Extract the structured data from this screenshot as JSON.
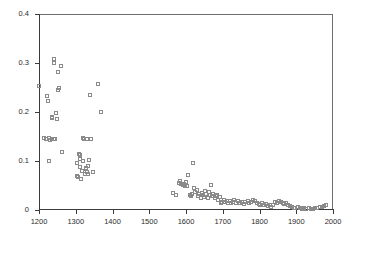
{
  "chart_data": {
    "type": "scatter",
    "title": "",
    "xlabel": "",
    "ylabel": "",
    "xlim": [
      1200,
      2000
    ],
    "ylim": [
      0,
      0.4
    ],
    "xticks": [
      1200,
      1300,
      1400,
      1500,
      1600,
      1700,
      1800,
      1900,
      2000
    ],
    "xtick_labels": [
      "1200",
      "1300",
      "1400",
      "1500",
      "1600",
      "1700",
      "1800",
      "1900",
      "2000"
    ],
    "yticks": [
      0,
      0.1,
      0.2,
      0.3,
      0.4
    ],
    "ytick_labels": [
      "0",
      "0.1",
      "0.2",
      "0.3",
      "0.4"
    ],
    "grid": false,
    "legend": null,
    "marker": "open-square",
    "marker_color": "#8a8a8a",
    "frame_color": "#3a3a3a",
    "series": [
      {
        "name": "series-1",
        "points": [
          [
            1200,
            0.252
          ],
          [
            1222,
            0.231
          ],
          [
            1226,
            0.221
          ],
          [
            1236,
            0.189
          ],
          [
            1238,
            0.186
          ],
          [
            1243,
            0.307
          ],
          [
            1243,
            0.299
          ],
          [
            1248,
            0.196
          ],
          [
            1250,
            0.185
          ],
          [
            1252,
            0.281
          ],
          [
            1254,
            0.243
          ],
          [
            1257,
            0.247
          ],
          [
            1262,
            0.292
          ],
          [
            1216,
            0.145
          ],
          [
            1221,
            0.143
          ],
          [
            1229,
            0.146
          ],
          [
            1232,
            0.141
          ],
          [
            1236,
            0.144
          ],
          [
            1241,
            0.143
          ],
          [
            1246,
            0.144
          ],
          [
            1228,
            0.1
          ],
          [
            1263,
            0.118
          ],
          [
            1305,
            0.094
          ],
          [
            1306,
            0.069
          ],
          [
            1308,
            0.066
          ],
          [
            1311,
            0.114
          ],
          [
            1312,
            0.111
          ],
          [
            1313,
            0.086
          ],
          [
            1314,
            0.104
          ],
          [
            1316,
            0.063
          ],
          [
            1318,
            0.079
          ],
          [
            1321,
            0.1
          ],
          [
            1322,
            0.146
          ],
          [
            1325,
            0.143
          ],
          [
            1327,
            0.073
          ],
          [
            1329,
            0.085
          ],
          [
            1330,
            0.082
          ],
          [
            1331,
            0.076
          ],
          [
            1333,
            0.143
          ],
          [
            1334,
            0.088
          ],
          [
            1336,
            0.073
          ],
          [
            1337,
            0.102
          ],
          [
            1339,
            0.234
          ],
          [
            1344,
            0.143
          ],
          [
            1347,
            0.076
          ],
          [
            1362,
            0.256
          ],
          [
            1370,
            0.2
          ],
          [
            1567,
            0.034
          ],
          [
            1574,
            0.03
          ],
          [
            1583,
            0.055
          ],
          [
            1586,
            0.058
          ],
          [
            1588,
            0.053
          ],
          [
            1592,
            0.051
          ],
          [
            1596,
            0.053
          ],
          [
            1599,
            0.048
          ],
          [
            1602,
            0.056
          ],
          [
            1605,
            0.048
          ],
          [
            1608,
            0.071
          ],
          [
            1611,
            0.029
          ],
          [
            1614,
            0.027
          ],
          [
            1617,
            0.031
          ],
          [
            1621,
            0.095
          ],
          [
            1624,
            0.043
          ],
          [
            1627,
            0.036
          ],
          [
            1631,
            0.04
          ],
          [
            1634,
            0.027
          ],
          [
            1637,
            0.032
          ],
          [
            1641,
            0.024
          ],
          [
            1644,
            0.034
          ],
          [
            1647,
            0.03
          ],
          [
            1650,
            0.026
          ],
          [
            1654,
            0.037
          ],
          [
            1657,
            0.031
          ],
          [
            1660,
            0.023
          ],
          [
            1663,
            0.036
          ],
          [
            1666,
            0.029
          ],
          [
            1670,
            0.049
          ],
          [
            1673,
            0.027
          ],
          [
            1676,
            0.031
          ],
          [
            1679,
            0.024
          ],
          [
            1683,
            0.027
          ],
          [
            1686,
            0.03
          ],
          [
            1689,
            0.02
          ],
          [
            1693,
            0.025
          ],
          [
            1696,
            0.013
          ],
          [
            1700,
            0.016
          ],
          [
            1704,
            0.02
          ],
          [
            1708,
            0.015
          ],
          [
            1712,
            0.018
          ],
          [
            1716,
            0.014
          ],
          [
            1720,
            0.017
          ],
          [
            1724,
            0.013
          ],
          [
            1729,
            0.016
          ],
          [
            1733,
            0.019
          ],
          [
            1738,
            0.014
          ],
          [
            1743,
            0.017
          ],
          [
            1748,
            0.013
          ],
          [
            1753,
            0.016
          ],
          [
            1758,
            0.012
          ],
          [
            1763,
            0.015
          ],
          [
            1769,
            0.018
          ],
          [
            1774,
            0.014
          ],
          [
            1779,
            0.016
          ],
          [
            1784,
            0.019
          ],
          [
            1789,
            0.017
          ],
          [
            1794,
            0.014
          ],
          [
            1799,
            0.012
          ],
          [
            1804,
            0.01
          ],
          [
            1809,
            0.013
          ],
          [
            1814,
            0.009
          ],
          [
            1819,
            0.011
          ],
          [
            1824,
            0.007
          ],
          [
            1829,
            0.009
          ],
          [
            1834,
            0.006
          ],
          [
            1839,
            0.01
          ],
          [
            1844,
            0.016
          ],
          [
            1849,
            0.014
          ],
          [
            1854,
            0.017
          ],
          [
            1859,
            0.015
          ],
          [
            1864,
            0.013
          ],
          [
            1869,
            0.011
          ],
          [
            1874,
            0.013
          ],
          [
            1879,
            0.01
          ],
          [
            1884,
            0.008
          ],
          [
            1889,
            0.006
          ],
          [
            1894,
            0.004
          ],
          [
            1899,
            0.003
          ],
          [
            1905,
            0.005
          ],
          [
            1911,
            0.003
          ],
          [
            1917,
            0.002
          ],
          [
            1923,
            0.004
          ],
          [
            1929,
            0.002
          ],
          [
            1935,
            0.003
          ],
          [
            1941,
            0.002
          ],
          [
            1947,
            0.001
          ],
          [
            1953,
            0.003
          ],
          [
            1959,
            0.004
          ],
          [
            1965,
            0.006
          ],
          [
            1971,
            0.005
          ],
          [
            1977,
            0.008
          ],
          [
            1983,
            0.01
          ]
        ]
      }
    ]
  }
}
